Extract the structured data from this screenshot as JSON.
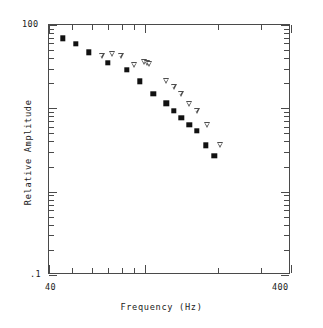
{
  "chart_data": {
    "type": "scatter",
    "title": "",
    "xlabel": "Frequency  (Hz)",
    "ylabel": "Relative Amplitude",
    "xscale": "log",
    "yscale": "log",
    "xlim": [
      40,
      400
    ],
    "ylim": [
      0.1,
      100
    ],
    "xtick_labels": [
      "40",
      "400"
    ],
    "ytick_labels": [
      "100",
      ".1"
    ],
    "xticks_minor": [
      50,
      60,
      70,
      80,
      90,
      100,
      200,
      300
    ],
    "grid": false,
    "legend": "none",
    "series": [
      {
        "name": "filled-square",
        "marker": "square",
        "filled": true,
        "color": "#111111",
        "points": [
          {
            "x": 45.5,
            "y": 69.0
          },
          {
            "x": 51.5,
            "y": 59.0
          },
          {
            "x": 58.5,
            "y": 47.0
          },
          {
            "x": 70.0,
            "y": 35.0
          },
          {
            "x": 84.0,
            "y": 29.0
          },
          {
            "x": 95.0,
            "y": 21.0
          },
          {
            "x": 108.0,
            "y": 15.0
          },
          {
            "x": 122.0,
            "y": 11.5
          },
          {
            "x": 131.0,
            "y": 9.3
          },
          {
            "x": 141.0,
            "y": 7.7
          },
          {
            "x": 152.0,
            "y": 6.3
          },
          {
            "x": 163.0,
            "y": 5.4
          },
          {
            "x": 178.0,
            "y": 3.6
          },
          {
            "x": 193.0,
            "y": 2.7
          }
        ]
      },
      {
        "name": "open-triangle-down",
        "marker": "triangle-down",
        "filled": false,
        "color": "#4d4d4d",
        "points": [
          {
            "x": 66.0,
            "y": 42.0
          },
          {
            "x": 73.0,
            "y": 45.0
          },
          {
            "x": 79.0,
            "y": 42.0
          },
          {
            "x": 90.0,
            "y": 33.0
          },
          {
            "x": 99.0,
            "y": 36.0
          },
          {
            "x": 101.5,
            "y": 35.0
          },
          {
            "x": 104.0,
            "y": 34.0
          },
          {
            "x": 122.0,
            "y": 21.0
          },
          {
            "x": 131.0,
            "y": 18.0
          },
          {
            "x": 140.0,
            "y": 15.0
          },
          {
            "x": 152.0,
            "y": 11.3
          },
          {
            "x": 163.0,
            "y": 9.3
          },
          {
            "x": 180.0,
            "y": 6.3
          },
          {
            "x": 204.0,
            "y": 3.6
          }
        ]
      }
    ]
  },
  "axes": {
    "y_top_label": "100",
    "y_bottom_label": ".1",
    "x_left_label": "40",
    "x_right_label": "400",
    "x_title": "Frequency  (Hz)",
    "y_title": "Relative Amplitude"
  }
}
